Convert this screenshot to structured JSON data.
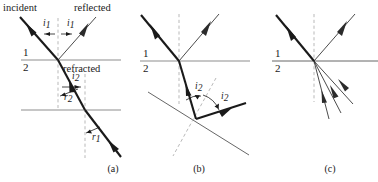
{
  "figure": {
    "background_color": "#ffffff",
    "width": 378,
    "height": 182,
    "ray_color": "#1a1a1a",
    "surface_color": "#8e8e8e",
    "normal_color": "#b9b9b9"
  },
  "panels": [
    {
      "id": "a",
      "caption": "(a)",
      "caption_x": 113,
      "caption_y": 172,
      "labels": {
        "incident": "incident",
        "reflected": "reflected",
        "refracted": "refracted",
        "medium_upper": "1",
        "medium_lower": "2"
      },
      "angles": [
        {
          "name": "angle-i1-left",
          "base": "i",
          "sub": "1",
          "x": 43,
          "y": 26
        },
        {
          "name": "angle-i1-right",
          "base": "i",
          "sub": "1",
          "x": 67,
          "y": 26
        },
        {
          "name": "angle-i2",
          "base": "i",
          "sub": "2",
          "x": 72,
          "y": 79
        },
        {
          "name": "angle-r2",
          "base": "r",
          "sub": "2",
          "x": 64,
          "y": 100
        },
        {
          "name": "angle-r1",
          "base": "r",
          "sub": "1",
          "x": 92,
          "y": 140
        }
      ]
    },
    {
      "id": "b",
      "caption": "(b)",
      "caption_x": 199,
      "caption_y": 172,
      "labels": {
        "medium_upper": "1",
        "medium_lower": "2"
      },
      "angles": [
        {
          "name": "angle-i2-left",
          "base": "i",
          "sub": "2",
          "x": 195,
          "y": 89
        },
        {
          "name": "angle-i2-right",
          "base": "i",
          "sub": "2",
          "x": 221,
          "y": 99
        }
      ]
    },
    {
      "id": "c",
      "caption": "(c)",
      "caption_x": 330,
      "caption_y": 172,
      "labels": {
        "medium_upper": "1",
        "medium_lower": "2"
      },
      "angles": []
    }
  ]
}
